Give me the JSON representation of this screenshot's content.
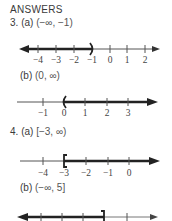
{
  "header": {
    "title": "ANSWERS"
  },
  "problems": [
    {
      "number": "3.",
      "parts": [
        {
          "label": "(a)",
          "interval": "(−∞, −1)",
          "number_line": {
            "ticks": [
              "−4",
              "−3",
              "−2",
              "−1",
              "0",
              "1",
              "2"
            ],
            "shaded": "left",
            "endpoint": "−1",
            "endpoint_symbol": ")"
          }
        },
        {
          "label": "(b)",
          "interval": "(0, ∞)",
          "number_line": {
            "ticks": [
              "−1",
              "0",
              "1",
              "2",
              "3"
            ],
            "shaded": "right",
            "endpoint": "0",
            "endpoint_symbol": "("
          }
        }
      ]
    },
    {
      "number": "4.",
      "parts": [
        {
          "label": "(a)",
          "interval": "[−3, ∞)",
          "number_line": {
            "ticks": [
              "−4",
              "−3",
              "−2",
              "−1",
              "0"
            ],
            "shaded": "right",
            "endpoint": "−3",
            "endpoint_symbol": "["
          }
        },
        {
          "label": "(b)",
          "interval": "(−∞, 5]",
          "number_line": {
            "ticks": [
              "",
              "",
              "",
              "5",
              ""
            ],
            "shaded": "left",
            "endpoint": "5",
            "endpoint_symbol": "]"
          }
        }
      ]
    }
  ],
  "colors": {
    "ink": "#2a2a2a",
    "line": "#555555",
    "text": "#3a3a3a"
  }
}
